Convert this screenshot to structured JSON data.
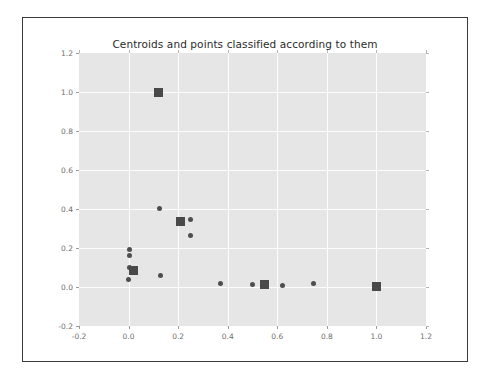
{
  "figure": {
    "title": "Centroids and points classified according to them",
    "background_color": "#ffffff",
    "axes_background_color": "#e6e6e6",
    "grid_color": "#fdfdfd",
    "frame_color": "#3a3a3a",
    "marker_color": "#4e4e4e",
    "centroid_color": "#494949"
  },
  "chart_data": {
    "type": "scatter",
    "title": "Centroids and points classified according to them",
    "xlabel": "",
    "ylabel": "",
    "xlim": [
      -0.2,
      1.2
    ],
    "ylim": [
      -0.2,
      1.2
    ],
    "xticks": [
      -0.2,
      0.0,
      0.2,
      0.4,
      0.6,
      0.8,
      1.0,
      1.2
    ],
    "xticklabels": [
      "-0.2",
      "0.0",
      "0.2",
      "0.4",
      "0.6",
      "0.8",
      "1.0",
      "1.2"
    ],
    "yticks": [
      -0.2,
      0.0,
      0.2,
      0.4,
      0.6,
      0.8,
      1.0,
      1.2
    ],
    "yticklabels": [
      "-0.2",
      "0.0",
      "0.2",
      "0.4",
      "0.6",
      "0.8",
      "1.0",
      "1.2"
    ],
    "grid": true,
    "legend": null,
    "series": [
      {
        "name": "points",
        "marker": "circle",
        "color": "#4e4e4e",
        "size": 5,
        "x": [
          0.002,
          0.002,
          0.004,
          0.0,
          0.125,
          0.25,
          0.25,
          0.128,
          0.372,
          0.5,
          0.545,
          0.62,
          0.745
        ],
        "y": [
          0.192,
          0.163,
          0.1,
          0.037,
          0.404,
          0.345,
          0.263,
          0.058,
          0.02,
          0.012,
          0.012,
          0.01,
          0.02
        ]
      },
      {
        "name": "centroids",
        "marker": "square",
        "color": "#494949",
        "size": 9,
        "x": [
          0.12,
          0.018,
          0.21,
          0.548,
          1.0
        ],
        "y": [
          1.0,
          0.085,
          0.335,
          0.012,
          0.003
        ]
      }
    ]
  }
}
